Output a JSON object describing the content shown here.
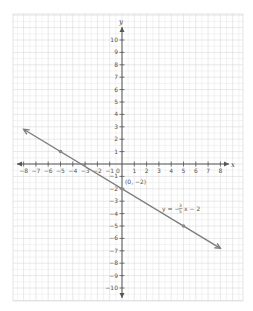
{
  "chart_data": {
    "type": "line",
    "title": "",
    "xlabel": "x",
    "ylabel": "y",
    "xlim": [
      -8,
      8
    ],
    "ylim": [
      -10,
      10
    ],
    "grid": true,
    "x_ticks": [
      -8,
      -7,
      -6,
      -5,
      -4,
      -3,
      -2,
      -1,
      0,
      1,
      2,
      3,
      4,
      5,
      6,
      7,
      8
    ],
    "y_ticks": [
      -10,
      -9,
      -8,
      -7,
      -6,
      -5,
      -4,
      -3,
      -2,
      -1,
      1,
      2,
      3,
      4,
      5,
      6,
      7,
      8,
      9,
      10
    ],
    "x_tick_labels": [
      "-8",
      "-7",
      "-6",
      "-5",
      "-4",
      "-3",
      "-2",
      "-1",
      "0",
      "1",
      "2",
      "3",
      "4",
      "5",
      "6",
      "7",
      "8"
    ],
    "y_tick_labels": [
      "-10",
      "-9",
      "-8",
      "-7",
      "-6",
      "-5",
      "-4",
      "-3",
      "-2",
      "-1",
      "1",
      "2",
      "3",
      "4",
      "5",
      "6",
      "7",
      "8",
      "9",
      "10"
    ],
    "series": [
      {
        "name": "y = -3/5 x - 2",
        "slope": -0.6,
        "intercept": -2,
        "x": [
          -8,
          8
        ],
        "y": [
          2.8,
          -6.8
        ],
        "arrows_both_ends": true,
        "color": "#7a7a7a"
      }
    ],
    "points": [
      {
        "x": -5,
        "y": 1
      },
      {
        "x": 0,
        "y": -2,
        "label": "(0, -2)"
      },
      {
        "x": 5,
        "y": -5
      }
    ],
    "annotations": [
      {
        "text": "(0, -2)",
        "x": 0.2,
        "y": -1.6
      },
      {
        "text": "y = -3/5 x - 2",
        "x": 3.6,
        "y": -3.3
      }
    ]
  },
  "labels": {
    "x_axis": "x",
    "y_axis": "y",
    "intercept_label": "(0, −2)",
    "equation_prefix": "y = −",
    "equation_num": "3",
    "equation_den": "5",
    "equation_suffix": "x − 2"
  },
  "colors": {
    "grid_minor": "#e6e6e6",
    "grid_major": "#d2d2d2",
    "axis": "#555555",
    "line": "#7a7a7a",
    "point": "#8a8a8a"
  }
}
